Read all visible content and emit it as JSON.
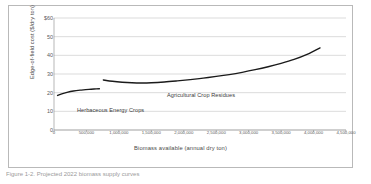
{
  "figure": {
    "caption": "Figure 1-2. Projected 2022 biomass supply curves"
  },
  "chart_data": {
    "type": "line",
    "title": "",
    "xlabel": "Biomass available (annual dry ton)",
    "ylabel": "Edge-of-field cost ($/dry ton)",
    "xlim": [
      0,
      4500000
    ],
    "ylim": [
      0,
      60
    ],
    "grid": true,
    "legend_position": "inline-annotation",
    "ytick_labels": [
      "$60",
      "50",
      "40",
      "30",
      "20",
      "10",
      "0"
    ],
    "ytick_values": [
      60,
      50,
      40,
      30,
      20,
      10,
      0
    ],
    "xtick_labels": [
      "0",
      "500,000",
      "1,000,000",
      "1,500,000",
      "2,000,000",
      "2,500,000",
      "3,000,000",
      "3,500,000",
      "4,000,000",
      "4,500,000"
    ],
    "xtick_values": [
      0,
      500000,
      1000000,
      1500000,
      2000000,
      2500000,
      3000000,
      3500000,
      4000000,
      4500000
    ],
    "series": [
      {
        "name": "Herbaceous Energy Crops",
        "color": "#1a1a1a",
        "x": [
          55000,
          120000,
          200000,
          300000,
          420000,
          540000,
          650000,
          700000
        ],
        "y": [
          18.5,
          19.4,
          20.2,
          20.9,
          21.4,
          21.8,
          22.0,
          22.1
        ]
      },
      {
        "name": "Agricultural Crop Residues",
        "color": "#1a1a1a",
        "x": [
          760000,
          900000,
          1050000,
          1200000,
          1350000,
          1500000,
          1700000,
          1900000,
          2100000,
          2300000,
          2500000,
          2700000,
          2900000,
          3100000,
          3300000,
          3500000,
          3700000,
          3900000,
          4100000
        ],
        "y": [
          26.8,
          26.1,
          25.6,
          25.3,
          25.2,
          25.3,
          25.7,
          26.3,
          27.0,
          27.8,
          28.7,
          29.7,
          30.9,
          32.3,
          33.9,
          35.7,
          37.8,
          40.5,
          44.0
        ]
      }
    ],
    "annotations": [
      {
        "text": "Herbaceous Energy Crops",
        "x": 300000,
        "y": 16.5
      },
      {
        "text": "Agricultural Crop Residues",
        "x": 2150000,
        "y": 23.0
      }
    ]
  }
}
